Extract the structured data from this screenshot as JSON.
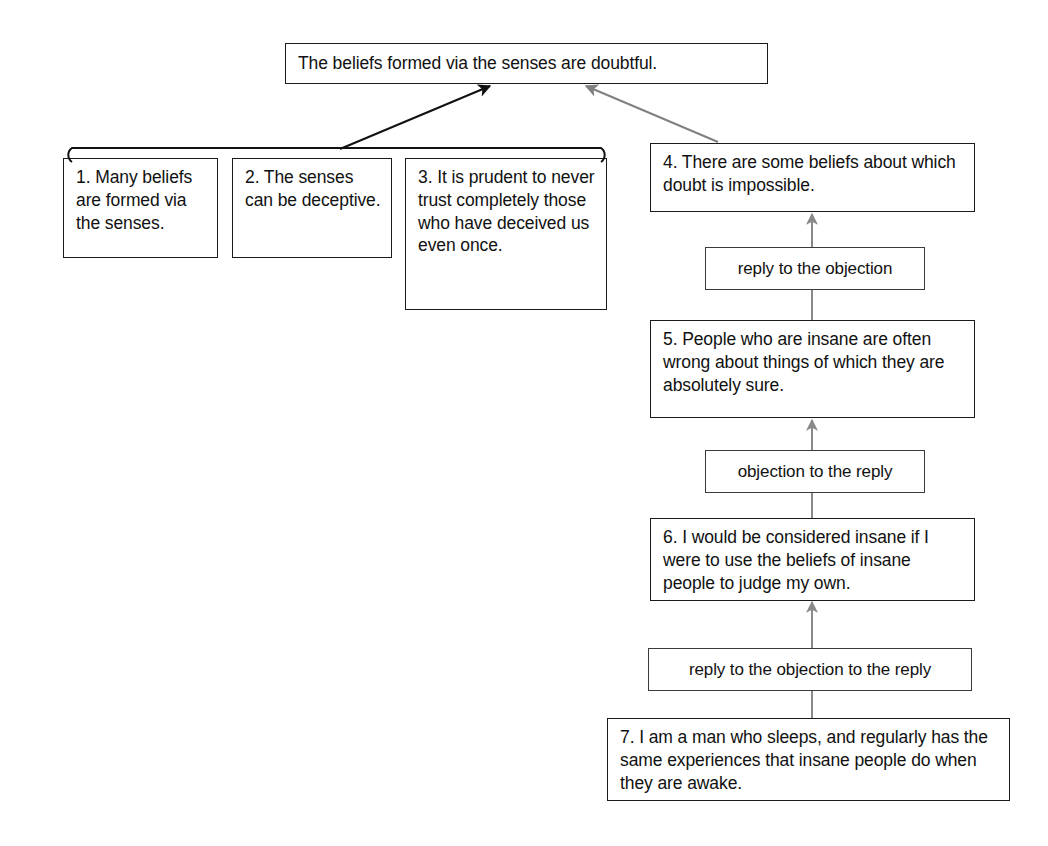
{
  "diagram": {
    "type": "argument-map",
    "colors": {
      "box_border": "#1a1a1a",
      "label_border": "#3a3a3a",
      "text": "#111111",
      "arrow_black": "#111111",
      "arrow_gray": "#808080",
      "background": "#ffffff"
    },
    "conclusion": {
      "id": "conclusion",
      "text": "The beliefs formed via the senses are doubtful."
    },
    "premises": [
      {
        "id": "p1",
        "number": "1.",
        "text": "1. Many beliefs are formed via the senses."
      },
      {
        "id": "p2",
        "number": "2.",
        "text": "2. The senses can be deceptive."
      },
      {
        "id": "p3",
        "number": "3.",
        "text": "3. It is prudent to never trust completely those who have deceived us even once."
      }
    ],
    "objection_chain": [
      {
        "id": "p4",
        "number": "4.",
        "text": "4. There are some beliefs about which doubt is impossible."
      },
      {
        "id": "p5",
        "number": "5.",
        "text": "5. People who are insane are often wrong about things of which they are absolutely sure."
      },
      {
        "id": "p6",
        "number": "6.",
        "text": "6. I would be considered insane if I were to use the beliefs of insane people to judge my own."
      },
      {
        "id": "p7",
        "number": "7.",
        "text": "7. I am a man who sleeps, and regularly has the same experiences that insane people do when they are awake."
      }
    ],
    "relation_labels": [
      {
        "id": "rel1",
        "text": "reply to the objection"
      },
      {
        "id": "rel2",
        "text": "objection to the reply"
      },
      {
        "id": "rel3",
        "text": "reply to the objection to the reply"
      }
    ]
  }
}
